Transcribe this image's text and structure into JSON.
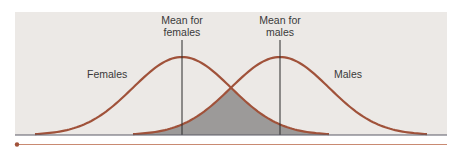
{
  "chart_data": {
    "type": "area",
    "title": "",
    "xlabel": "",
    "ylabel": "",
    "series": [
      {
        "name": "Females",
        "mean": 0,
        "sd": 1
      },
      {
        "name": "Males",
        "mean": 2,
        "sd": 1
      }
    ],
    "x_range": [
      -3,
      5
    ],
    "overlap_shaded": true,
    "annotations": [
      {
        "text_lines": [
          "Mean for",
          "females"
        ],
        "at_series": "Females"
      },
      {
        "text_lines": [
          "Mean for",
          "males"
        ],
        "at_series": "Males"
      }
    ],
    "legend": "none"
  },
  "labels": {
    "females": "Females",
    "males": "Males",
    "mean_females_1": "Mean for",
    "mean_females_2": "females",
    "mean_males_1": "Mean for",
    "mean_males_2": "males"
  },
  "colors": {
    "panel": "#ece9e6",
    "curve": "#a0523a",
    "overlap": "#9c9a99",
    "axis": "#5a5a66",
    "mean_line": "#2a2a2a",
    "rule": "#c98a72"
  }
}
